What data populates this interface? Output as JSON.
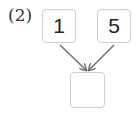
{
  "problem": {
    "label": "(2)",
    "inputs": [
      {
        "value": "1"
      },
      {
        "value": "5"
      }
    ],
    "result": {
      "value": ""
    }
  },
  "colors": {
    "box_border": "#cfcfcf",
    "arrow": "#6e6e6e",
    "text": "#222222"
  }
}
